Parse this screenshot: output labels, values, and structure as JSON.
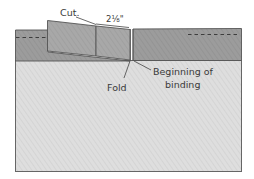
{
  "diagram": {
    "type": "binding-join-illustration",
    "colors": {
      "quilt": "#dedede",
      "binding": "#9a9a9a",
      "flap": "#a6a6a6",
      "outline": "#555555",
      "leader": "#444444",
      "text": "#3a3a3a"
    },
    "labels": {
      "cut": "Cut.",
      "measurement": "2⅛\"",
      "fold": "Fold",
      "beginning_line1": "Beginning of",
      "beginning_line2": "binding"
    }
  }
}
